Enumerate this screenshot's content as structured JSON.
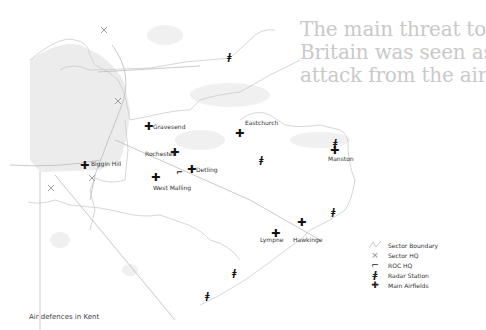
{
  "headline": {
    "lines": [
      "The main threat to",
      "Britain was seen as",
      "attack from the air"
    ]
  },
  "caption": "Air defences in Kent",
  "colors": {
    "headline": "#c9c9c9",
    "boundary": "#cccccc",
    "land_shade": "#eeeeee",
    "marker": "#111111"
  },
  "places": [
    {
      "name": "Gravesend",
      "type": "airfield",
      "x": 149,
      "y": 126
    },
    {
      "name": "Eastchurch",
      "type": "airfield",
      "x": 240,
      "y": 133
    },
    {
      "name": "Rochester",
      "type": "airfield",
      "x": 175,
      "y": 152
    },
    {
      "name": "Detling",
      "type": "airfield",
      "x": 192,
      "y": 169
    },
    {
      "name": "Biggin Hill",
      "type": "airfield",
      "x": 85,
      "y": 165
    },
    {
      "name": "West Malling",
      "type": "airfield",
      "x": 156,
      "y": 177
    },
    {
      "name": "Manston",
      "type": "airfield",
      "x": 335,
      "y": 150
    },
    {
      "name": "Hawkinge",
      "type": "airfield",
      "x": 302,
      "y": 222
    },
    {
      "name": "Lympne",
      "type": "airfield",
      "x": 276,
      "y": 233
    }
  ],
  "labels": {
    "gravesend": "Gravesend",
    "eastchurch": "Eastchurch",
    "rochester": "Rochester",
    "detling": "Detling",
    "biggin_hill": "Biggin Hill",
    "west_malling": "West Malling",
    "manston": "Manston",
    "hawkinge": "Hawkinge",
    "lympne": "Lympne"
  },
  "legend": {
    "items": [
      {
        "icon": "sector-boundary",
        "label": "Sector Boundary"
      },
      {
        "icon": "sector-hq",
        "label": "Sector HQ"
      },
      {
        "icon": "roc-hq",
        "label": "ROC HQ"
      },
      {
        "icon": "radar-station",
        "label": "Radar Station"
      },
      {
        "icon": "main-airfield",
        "label": "Main Airfields"
      }
    ]
  },
  "glyphs": {
    "airfield": "✚",
    "sector_hq": "×",
    "roc_hq": "⌐",
    "radar": "ǂ"
  }
}
